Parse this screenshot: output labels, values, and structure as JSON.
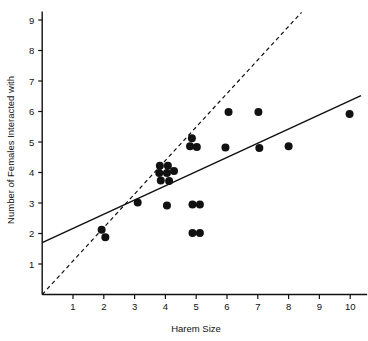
{
  "chart_data": {
    "type": "scatter",
    "title": "",
    "xlabel": "Harem Size",
    "ylabel": "Number of Females Interacted with",
    "xlim": [
      0,
      10.6
    ],
    "ylim": [
      0,
      9.3
    ],
    "xticks": [
      1,
      2,
      3,
      4,
      5,
      6,
      7,
      8,
      9,
      10
    ],
    "yticks": [
      1,
      2,
      3,
      4,
      5,
      6,
      7,
      8,
      9
    ],
    "grid": false,
    "legend": "none",
    "points": [
      {
        "x": 1.93,
        "y": 2.12
      },
      {
        "x": 2.05,
        "y": 1.88
      },
      {
        "x": 3.82,
        "y": 4.22
      },
      {
        "x": 4.08,
        "y": 4.22
      },
      {
        "x": 3.8,
        "y": 3.98
      },
      {
        "x": 4.05,
        "y": 3.98
      },
      {
        "x": 4.28,
        "y": 4.05
      },
      {
        "x": 3.85,
        "y": 3.74
      },
      {
        "x": 4.12,
        "y": 3.72
      },
      {
        "x": 3.1,
        "y": 3.02
      },
      {
        "x": 4.05,
        "y": 2.92
      },
      {
        "x": 4.86,
        "y": 5.12
      },
      {
        "x": 4.8,
        "y": 4.86
      },
      {
        "x": 5.02,
        "y": 4.84
      },
      {
        "x": 4.88,
        "y": 2.95
      },
      {
        "x": 5.12,
        "y": 2.95
      },
      {
        "x": 4.88,
        "y": 2.02
      },
      {
        "x": 5.12,
        "y": 2.02
      },
      {
        "x": 5.95,
        "y": 4.82
      },
      {
        "x": 6.05,
        "y": 5.98
      },
      {
        "x": 7.02,
        "y": 5.98
      },
      {
        "x": 7.05,
        "y": 4.8
      },
      {
        "x": 8.0,
        "y": 4.86
      },
      {
        "x": 9.98,
        "y": 5.92
      }
    ],
    "lines": [
      {
        "name": "regression-line",
        "style": "solid",
        "x0": 0.0,
        "y0": 1.7,
        "x1": 10.35,
        "y1": 6.52
      },
      {
        "name": "identity-line",
        "style": "dashed",
        "x0": 0.0,
        "y0": 0.0,
        "x1": 8.42,
        "y1": 9.25
      }
    ],
    "marker": {
      "shape": "circle",
      "color": "#111111",
      "radius": 4.0
    },
    "axis_color": "#111111"
  }
}
